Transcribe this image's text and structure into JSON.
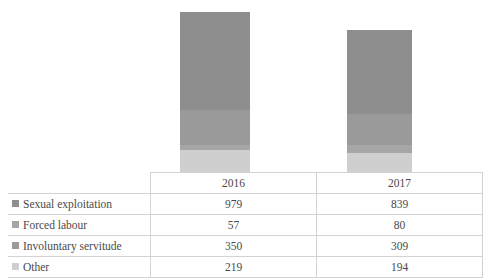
{
  "chart_data": {
    "type": "bar",
    "subtype": "stacked-column",
    "title": "",
    "xlabel": "",
    "ylabel": "",
    "grid": false,
    "legend_position": "table-row-headers",
    "categories": [
      "2016",
      "2017"
    ],
    "series": [
      {
        "name": "Sexual exploitation",
        "values": [
          979,
          839
        ],
        "color": "#8e8e8e"
      },
      {
        "name": "Forced labour",
        "values": [
          57,
          80
        ],
        "color": "#a6a6a6"
      },
      {
        "name": "Involuntary servitude",
        "values": [
          350,
          309
        ],
        "color": "#9a9a9a"
      },
      {
        "name": "Other",
        "values": [
          219,
          194
        ],
        "color": "#cfcfcf"
      }
    ],
    "totals": [
      1605,
      1422
    ],
    "ylim": [
      0,
      1605
    ]
  },
  "table": {
    "column_headers": [
      "",
      "2016",
      "2017"
    ],
    "rows": [
      {
        "category": "Sexual exploitation",
        "key_color": "#8e8e8e",
        "v2016": "979",
        "v2017": "839"
      },
      {
        "category": "Forced labour",
        "key_color": "#a6a6a6",
        "v2016": "57",
        "v2017": "80"
      },
      {
        "category": "Involuntary servitude",
        "key_color": "#9a9a9a",
        "v2016": "350",
        "v2017": "309"
      },
      {
        "category": "Other",
        "key_color": "#cfcfcf",
        "v2016": "219",
        "v2017": "194"
      }
    ]
  },
  "colors": {
    "series_1": "#8e8e8e",
    "series_2": "#a6a6a6",
    "series_3": "#9a9a9a",
    "series_4": "#cfcfcf",
    "border": "#d3d3d3",
    "text": "#4a4a4a",
    "background": "#ffffff"
  }
}
